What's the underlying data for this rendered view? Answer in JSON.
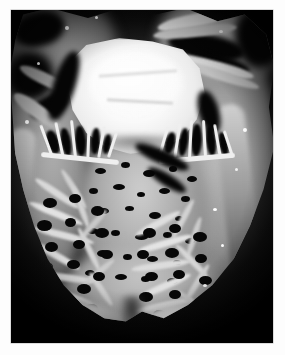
{
  "page": {
    "background_color": "#ffffff",
    "width": 285,
    "height": 355
  },
  "figure": {
    "name": "heart-gross-specimen-photograph",
    "type": "photograph",
    "modality": "gross pathology specimen photograph",
    "color_mode": "grayscale",
    "background_color": "#000000",
    "caption": "",
    "label": "",
    "plate": {
      "left": 11,
      "top": 10,
      "width": 262,
      "height": 333,
      "border_color": "#b9b9b9"
    },
    "regions": [
      {
        "name": "atrial-tissue-upper-left",
        "description": "pale folded atrial wall and pericardial tissue at upper left with dark shadowed recesses",
        "tone": "#8f8f8f"
      },
      {
        "name": "great-vessel-upper-right",
        "description": "pale vessel / valve tissue strands crossing upper right over black shadow",
        "tone": "#cfcfcf"
      },
      {
        "name": "valve-leaflet-bright-center",
        "description": "large bright white fibrous leaflet / thickened valve mass occupying upper centre",
        "tone": "#f2f2f2"
      },
      {
        "name": "chordae-tendineae-left",
        "description": "fine bright cords with dark interspaces on the left below the valve",
        "tone": "#e6e6e6"
      },
      {
        "name": "chordae-tendineae-right",
        "description": "fine bright cords with dark interspaces on the right below the valve",
        "tone": "#e6e6e6"
      },
      {
        "name": "interventricular-septum",
        "description": "broad mid-grey muscular septum pitted with small dark cut trabecular spaces",
        "tone": "#a8a8a8"
      },
      {
        "name": "left-ventricular-free-wall",
        "description": "thick grey myocardial wall along the right margin of the image",
        "tone": "#9a9a9a"
      },
      {
        "name": "right-ventricular-free-wall",
        "description": "thinner myocardial wall along the left margin of the image",
        "tone": "#8d8d8d"
      },
      {
        "name": "trabeculae-carneae-apex",
        "description": "dense coarse network of bright muscular trabeculae filling the lower half toward the apex",
        "tone": "#d2d2d2"
      },
      {
        "name": "apex",
        "description": "rounded inferior apex of the heart with smooth pale epicardial rim",
        "tone": "#b5b5b5"
      }
    ]
  }
}
